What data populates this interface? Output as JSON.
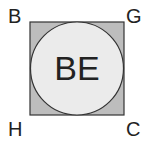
{
  "diagram": {
    "center_label": "BE",
    "corners": {
      "top_left": "B",
      "top_right": "G",
      "bottom_left": "H",
      "bottom_right": "C"
    },
    "colors": {
      "square_fill": "#bdbdbd",
      "circle_fill": "#ebebeb",
      "stroke": "#333333",
      "text": "#222222"
    }
  }
}
